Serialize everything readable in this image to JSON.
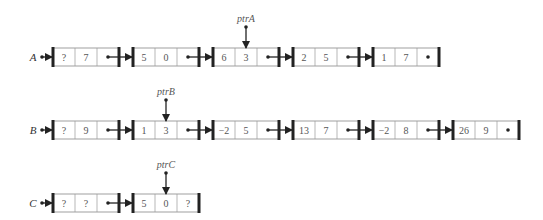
{
  "lists": [
    {
      "name": "A",
      "pointer": {
        "label": "ptrA",
        "node": 2,
        "field": 1
      },
      "nodes": [
        [
          "?",
          "7"
        ],
        [
          "5",
          "0"
        ],
        [
          "6",
          "3"
        ],
        [
          "2",
          "5"
        ],
        [
          "1",
          "7"
        ]
      ],
      "y": 57
    },
    {
      "name": "B",
      "pointer": {
        "label": "ptrB",
        "node": 1,
        "field": 1
      },
      "nodes": [
        [
          "?",
          "9"
        ],
        [
          "1",
          "3"
        ],
        [
          "−2",
          "5"
        ],
        [
          "13",
          "7"
        ],
        [
          "−2",
          "8"
        ],
        [
          "26",
          "9"
        ]
      ],
      "y": 130
    },
    {
      "name": "C",
      "pointer": {
        "label": "ptrC",
        "node": 1,
        "field": 1
      },
      "nodes": [
        [
          "?",
          "?"
        ],
        [
          "5",
          "0",
          "?"
        ]
      ],
      "y": 203
    }
  ],
  "colors": {
    "stroke": "#222222",
    "box": "#888888",
    "text": "#555555"
  }
}
